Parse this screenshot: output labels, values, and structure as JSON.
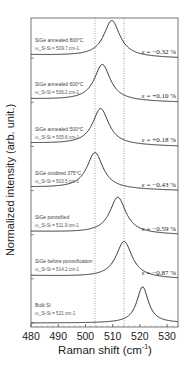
{
  "chart_data": {
    "type": "line",
    "title": "",
    "xlabel": "Raman shift (cm-1)",
    "xlabel_main": "Raman shift (cm",
    "xlabel_sup": "-1",
    "xlabel_close": ")",
    "ylabel": "Normalized intensity (arb. unit.)",
    "xlim": [
      480,
      534
    ],
    "xticks": [
      480,
      490,
      500,
      510,
      520,
      530
    ],
    "grid": false,
    "legend": "none",
    "reference_lines": [
      {
        "x": 503.5,
        "style": "dotted"
      },
      {
        "x": 514.2,
        "style": "dotted"
      }
    ],
    "series": [
      {
        "name": "SiGe annealed 800°C",
        "peak_label": "ω_Si-Si = 509.7 cm-1",
        "peak": 509.7,
        "strain": "ε = −0.32 %"
      },
      {
        "name": "SiGe annealed 600°C",
        "peak_label": "ω_Si-Si = 506.2 cm-1",
        "peak": 506.2,
        "strain": "ε = +0.10 %"
      },
      {
        "name": "SiGe annealed 500°C",
        "peak_label": "ω_Si-Si = 505.6 cm-1",
        "peak": 505.6,
        "strain": "ε = +0.18 %"
      },
      {
        "name": "SiGe oxidized 375°C",
        "peak_label": "ω_Si-Si = 503.5 cm-1",
        "peak": 503.5,
        "strain": "ε = −0.43 %"
      },
      {
        "name": "SiGe porosified",
        "peak_label": "ω_Si-Si = 511.9 cm-1",
        "peak": 511.9,
        "strain": "ε = −0.59 %"
      },
      {
        "name": "SiGe before porosification",
        "peak_label": "ω_Si-Si = 514.2 cm-1",
        "peak": 514.2,
        "strain": "ε = −0.87 %"
      },
      {
        "name": "Bulk Si",
        "peak_label": "ω_Si-Si = 521 cm-1",
        "peak": 521.0,
        "strain": ""
      }
    ]
  }
}
